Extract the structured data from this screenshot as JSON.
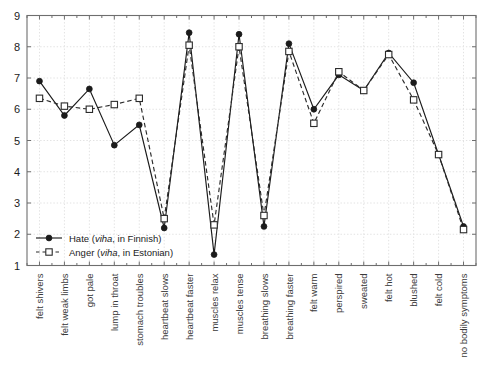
{
  "chart_data": {
    "type": "line",
    "title": "",
    "xlabel": "",
    "ylabel": "",
    "ylim": [
      1,
      9
    ],
    "yticks": [
      1,
      2,
      3,
      4,
      5,
      6,
      7,
      8,
      9
    ],
    "grid": true,
    "legend_position": "bottom-left",
    "categories": [
      "felt shivers",
      "felt weak limbs",
      "got pale",
      "lump in throat",
      "stomach troubles",
      "heartbeat slows",
      "heartbeat faster",
      "muscles relax",
      "muscles tense",
      "breathing slows",
      "breathing faster",
      "felt warm",
      "perspired",
      "sweated",
      "felt hot",
      "blushed",
      "felt cold",
      "no bodily symptoms"
    ],
    "series": [
      {
        "name": "Hate (viha, in Finnish)",
        "name_plain": "Hate",
        "name_italic": "viha",
        "name_suffix": ", in Finnish)",
        "marker": "filled-circle",
        "line_style": "solid",
        "color": "#1b1b1b",
        "values": [
          6.9,
          5.8,
          6.65,
          4.85,
          5.5,
          2.2,
          8.45,
          1.35,
          8.4,
          2.25,
          8.1,
          6.0,
          7.1,
          6.6,
          7.8,
          6.85,
          4.55,
          2.25
        ]
      },
      {
        "name": "Anger (viha, in Estonian)",
        "name_plain": "Anger",
        "name_italic": "viha",
        "name_suffix": ", in Estonian)",
        "marker": "open-square",
        "line_style": "dashed",
        "color": "#2b2b2b",
        "values": [
          6.35,
          6.1,
          6.0,
          6.15,
          6.35,
          2.5,
          8.05,
          2.3,
          8.0,
          2.6,
          7.85,
          5.55,
          7.2,
          6.6,
          7.75,
          6.3,
          4.55,
          2.15
        ]
      }
    ]
  },
  "legend": {
    "items": [
      {
        "prefix": "Hate (",
        "italic": "viha",
        "suffix": ", in Finnish)"
      },
      {
        "prefix": "Anger (",
        "italic": "viha",
        "suffix": ", in Estonian)"
      }
    ]
  },
  "colors": {
    "axis": "#6e6e6e",
    "grid": "#e2e2e2",
    "series_hate": "#1b1b1b",
    "series_anger": "#2b2b2b",
    "background": "#ffffff"
  }
}
